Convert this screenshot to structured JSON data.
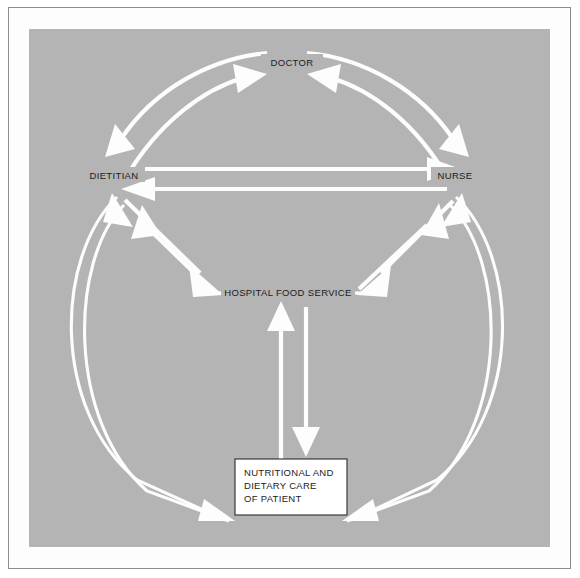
{
  "figure": {
    "background_color": "#b4b4b4",
    "arrow_color": "#fdfdfd",
    "text_color": "#1b1b1b",
    "box_fill": "#ffffff",
    "box_border": "#2a2a2a"
  },
  "nodes": {
    "doctor": {
      "label": "DOCTOR",
      "x": 262,
      "y": 35
    },
    "dietitian": {
      "label": "DIETITIAN",
      "x": 82,
      "y": 148
    },
    "nurse": {
      "label": "NURSE",
      "x": 425,
      "y": 148
    },
    "food_service": {
      "label": "HOSPITAL FOOD SERVICE",
      "x": 258,
      "y": 264
    },
    "patient_care": {
      "lines": [
        "NUTRITIONAL AND",
        "DIETARY CARE",
        "OF PATIENT"
      ],
      "x": 258,
      "y": 455
    }
  },
  "relationships": [
    {
      "from": "DIETITIAN",
      "to": "DOCTOR",
      "style": "curved-arc"
    },
    {
      "from": "DOCTOR",
      "to": "DIETITIAN",
      "style": "curved-arc"
    },
    {
      "from": "NURSE",
      "to": "DOCTOR",
      "style": "curved-arc"
    },
    {
      "from": "DOCTOR",
      "to": "NURSE",
      "style": "curved-arc"
    },
    {
      "from": "DIETITIAN",
      "to": "NURSE",
      "style": "straight"
    },
    {
      "from": "NURSE",
      "to": "DIETITIAN",
      "style": "straight"
    },
    {
      "from": "DIETITIAN",
      "to": "HOSPITAL FOOD SERVICE",
      "style": "straight-diagonal"
    },
    {
      "from": "HOSPITAL FOOD SERVICE",
      "to": "DIETITIAN",
      "style": "straight-diagonal"
    },
    {
      "from": "NURSE",
      "to": "HOSPITAL FOOD SERVICE",
      "style": "straight-diagonal"
    },
    {
      "from": "HOSPITAL FOOD SERVICE",
      "to": "NURSE",
      "style": "straight-diagonal"
    },
    {
      "from": "HOSPITAL FOOD SERVICE",
      "to": "NUTRITIONAL AND DIETARY CARE OF PATIENT",
      "style": "vertical"
    },
    {
      "from": "NUTRITIONAL AND DIETARY CARE OF PATIENT",
      "to": "HOSPITAL FOOD SERVICE",
      "style": "vertical"
    },
    {
      "from": "DIETITIAN",
      "to": "NUTRITIONAL AND DIETARY CARE OF PATIENT",
      "style": "outer-arc-left"
    },
    {
      "from": "NUTRITIONAL AND DIETARY CARE OF PATIENT",
      "to": "DIETITIAN",
      "style": "outer-arc-left"
    },
    {
      "from": "NURSE",
      "to": "NUTRITIONAL AND DIETARY CARE OF PATIENT",
      "style": "outer-arc-right"
    },
    {
      "from": "NUTRITIONAL AND DIETARY CARE OF PATIENT",
      "to": "NURSE",
      "style": "outer-arc-right"
    }
  ]
}
